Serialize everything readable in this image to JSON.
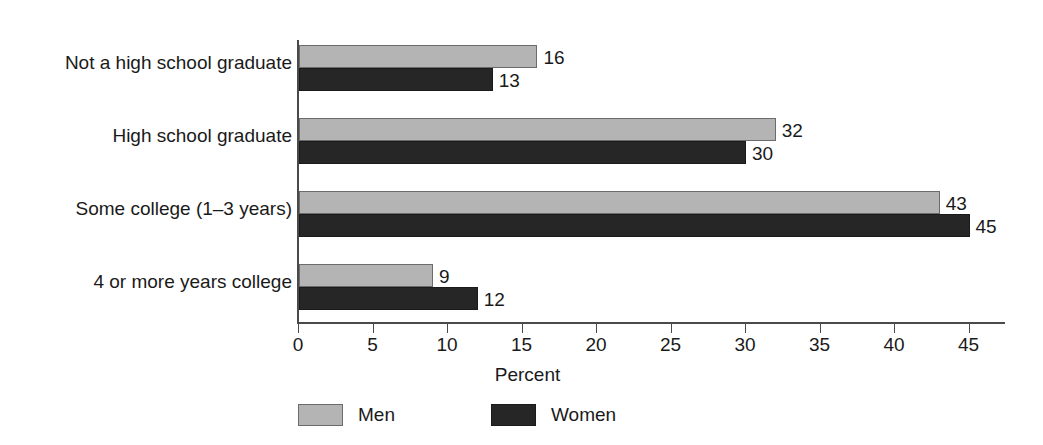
{
  "chart_data": {
    "type": "bar",
    "orientation": "horizontal",
    "title": "",
    "subtitle": "",
    "xlabel": "Percent",
    "ylabel": "",
    "categories": [
      "Not a high school graduate",
      "High school graduate",
      "Some college (1–3 years)",
      "4 or more years college"
    ],
    "series": [
      {
        "name": "Men",
        "values": [
          16,
          32,
          43,
          9
        ],
        "color": "#b4b4b4"
      },
      {
        "name": "Women",
        "values": [
          13,
          30,
          45,
          12
        ],
        "color": "#262626"
      }
    ],
    "xlim": [
      0,
      45
    ],
    "xticks": [
      0,
      5,
      10,
      15,
      20,
      25,
      30,
      35,
      40,
      45
    ],
    "xtick_labels": [
      "0",
      "5",
      "10",
      "15",
      "20",
      "25",
      "30",
      "35",
      "40",
      "45"
    ],
    "grid": false,
    "legend_position": "bottom-left",
    "value_labels": true
  },
  "legend": {
    "items": [
      {
        "label": "Men",
        "color": "#b4b4b4"
      },
      {
        "label": "Women",
        "color": "#262626"
      }
    ]
  },
  "axis": {
    "x_title": "Percent"
  }
}
